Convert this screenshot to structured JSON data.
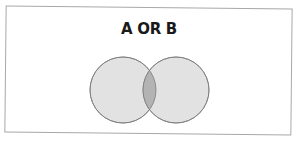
{
  "diagram": {
    "title": "A OR B",
    "type": "venn",
    "sets": [
      {
        "name": "A",
        "cx": 123,
        "cy": 90,
        "r": 33
      },
      {
        "name": "B",
        "cx": 176,
        "cy": 90,
        "r": 33
      }
    ],
    "colors": {
      "circle_fill": "#e2e2e2",
      "intersection_fill": "#b3b3b3",
      "stroke": "#7a7a7a",
      "frame": "#a8a8a8"
    }
  }
}
